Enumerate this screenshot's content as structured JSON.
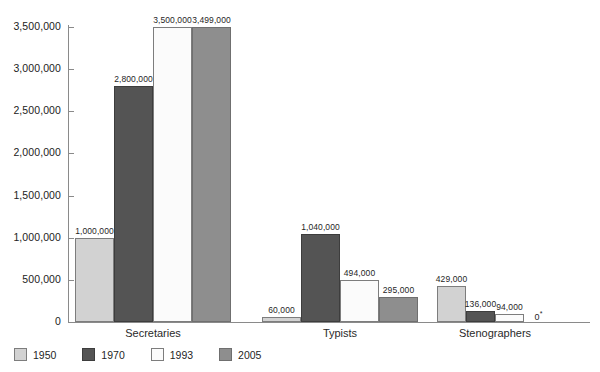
{
  "chart_data": {
    "type": "bar",
    "title": "",
    "subtitle": "",
    "xlabel": "",
    "ylabel": "",
    "categories": [
      "Secretaries",
      "Typists",
      "Stenographers"
    ],
    "series": [
      {
        "name": "1950",
        "color": "#d2d2d2",
        "values": [
          1000000,
          60000,
          429000
        ],
        "labels": [
          "1,000,000",
          "60,000",
          "429,000"
        ]
      },
      {
        "name": "1970",
        "color": "#545454",
        "values": [
          2800000,
          1040000,
          136000
        ],
        "labels": [
          "2,800,000",
          "1,040,000",
          "136,000"
        ]
      },
      {
        "name": "1993",
        "color": "#fbfbfb",
        "values": [
          3500000,
          494000,
          94000
        ],
        "labels": [
          "3,500,000",
          "494,000",
          "94,000"
        ]
      },
      {
        "name": "2005",
        "color": "#8e8e8e",
        "values": [
          3499000,
          295000,
          0
        ],
        "labels": [
          "3,499,000",
          "295,000",
          "0*"
        ]
      }
    ],
    "ylim": [
      0,
      3500000
    ],
    "yticks": [
      0,
      500000,
      1000000,
      1500000,
      2000000,
      2500000,
      3000000,
      3500000
    ],
    "ytick_labels": [
      "0",
      "500,000",
      "1,000,000",
      "1,500,000",
      "2,000,000",
      "2,500,000",
      "3,000,000",
      "3,500,000"
    ],
    "grid": false,
    "legend_position": "bottom-left",
    "annotations": [
      "0*"
    ]
  },
  "legend": {
    "items": [
      {
        "label": "1950"
      },
      {
        "label": "1970"
      },
      {
        "label": "1993"
      },
      {
        "label": "2005"
      }
    ]
  }
}
